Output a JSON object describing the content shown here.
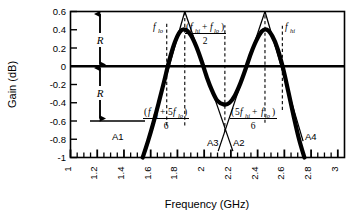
{
  "chart_data": {
    "type": "line",
    "title": "",
    "xlabel": "Frequency  (GHz)",
    "ylabel": "Gain (dB)",
    "xlim": [
      1,
      3.05
    ],
    "ylim": [
      -1,
      0.6
    ],
    "grid": false,
    "legend": "none",
    "xticks": [
      "1",
      "1.2",
      "1.4",
      "1.6",
      "1.8",
      "2",
      "2.2",
      "2.4",
      "2.6",
      "2.8",
      "3"
    ],
    "xtick_values": [
      1,
      1.2,
      1.4,
      1.6,
      1.8,
      2,
      2.2,
      2.4,
      2.6,
      2.8,
      3
    ],
    "minor_xtick_step": 0.05,
    "yticks": [
      "0.6",
      "0.4",
      "0.2",
      "0",
      "-0.2",
      "-0.4",
      "-0.6",
      "-0.8",
      "-1"
    ],
    "ytick_values": [
      0.6,
      0.4,
      0.2,
      0,
      -0.2,
      -0.4,
      -0.6,
      -0.8,
      -1
    ],
    "series": [
      {
        "name": "gain-response",
        "style": "thick-solid",
        "x": [
          1.54,
          1.58,
          1.62,
          1.66,
          1.7,
          1.74,
          1.78,
          1.82,
          1.86,
          1.9,
          1.94,
          1.98,
          2.02,
          2.06,
          2.1,
          2.15,
          2.19,
          2.23,
          2.27,
          2.31,
          2.35,
          2.39,
          2.43,
          2.47,
          2.51,
          2.55,
          2.59,
          2.63,
          2.67,
          2.71,
          2.75
        ],
        "y": [
          -1.0,
          -0.82,
          -0.62,
          -0.4,
          -0.17,
          0.07,
          0.26,
          0.38,
          0.4,
          0.34,
          0.22,
          0.06,
          -0.12,
          -0.27,
          -0.38,
          -0.42,
          -0.4,
          -0.32,
          -0.19,
          -0.03,
          0.14,
          0.28,
          0.38,
          0.4,
          0.33,
          0.19,
          -0.02,
          -0.28,
          -0.55,
          -0.8,
          -1.0
        ]
      },
      {
        "name": "asymptote-A1",
        "style": "thin-solid",
        "x": [
          1.545,
          1.855
        ],
        "y": [
          -1.0,
          0.6
        ]
      },
      {
        "name": "asymptote-A3",
        "style": "thin-solid",
        "x": [
          1.855,
          2.215
        ],
        "y": [
          0.6,
          -0.93
        ]
      },
      {
        "name": "asymptote-A2",
        "style": "thin-solid",
        "x": [
          2.105,
          2.455
        ],
        "y": [
          -0.93,
          0.6
        ]
      },
      {
        "name": "asymptote-A4",
        "style": "thin-solid",
        "x": [
          2.455,
          2.74
        ],
        "y": [
          0.6,
          -0.82
        ]
      }
    ],
    "vertical_dashed_lines": [
      {
        "name": "f-lo-line",
        "x": 1.72,
        "y0": -0.65,
        "y1": 0.47
      },
      {
        "name": "peak-lo-line",
        "x": 1.855,
        "y0": -0.65,
        "y1": 0.6
      },
      {
        "name": "mid-line",
        "x": 2.155,
        "y0": -0.72,
        "y1": 0.45
      },
      {
        "name": "peak-hi-line",
        "x": 2.455,
        "y0": -0.62,
        "y1": 0.6
      },
      {
        "name": "f-hi-line",
        "x": 2.585,
        "y0": -0.48,
        "y1": 0.47
      }
    ],
    "annotations": [
      {
        "name": "f-lo",
        "text": "f_lo",
        "base": "f",
        "sub": "lo",
        "x": 1.66,
        "y": 0.44
      },
      {
        "name": "f-hi",
        "text": "f_hi",
        "base": "f",
        "sub": "hi",
        "x": 2.63,
        "y": 0.44
      },
      {
        "name": "mid-formula",
        "text": "(f_hi + f_lo) / 2",
        "x": 2.06,
        "y": 0.45
      },
      {
        "name": "lower-sixth-formula",
        "text": "(f_hi + 5f_lo) / 6",
        "x": 1.77,
        "y": -0.51
      },
      {
        "name": "upper-sixth-formula",
        "text": "(5f_hi + f_lo) / 6",
        "x": 2.34,
        "y": -0.51
      },
      {
        "name": "label-A1",
        "text": "A1",
        "x": 1.47,
        "y": -0.78
      },
      {
        "name": "label-A2",
        "text": "A2",
        "x": 2.26,
        "y": -0.85
      },
      {
        "name": "label-A3",
        "text": "A3",
        "x": 2.06,
        "y": -0.85
      },
      {
        "name": "label-A4",
        "text": "A4",
        "x": 2.79,
        "y": -0.78
      },
      {
        "name": "ripple-upper",
        "text": "R",
        "x": 1.29,
        "y": 0.3
      },
      {
        "name": "ripple-lower",
        "text": "R",
        "x": 1.29,
        "y": -0.3
      }
    ],
    "ripple_arrows": [
      {
        "name": "ripple-arrow-upper",
        "x": 1.345,
        "y0": 0.0,
        "y1": 0.6
      },
      {
        "name": "ripple-arrow-lower",
        "x": 1.345,
        "y0": 0.0,
        "y1": -0.6
      }
    ],
    "reference_lines": [
      {
        "name": "zero-db-line",
        "y": 0
      },
      {
        "name": "minus-0p6-reference",
        "y": -0.6,
        "x0": 1.22,
        "x1": 1.63
      }
    ]
  },
  "axes": {
    "y_title": "Gain (dB)",
    "x_title": "Frequency  (GHz)"
  },
  "math": {
    "f": "f",
    "lo": "lo",
    "hi": "hi",
    "plus": "+",
    "five": "5",
    "two": "2",
    "six": "6",
    "paren_open": "(",
    "paren_close": ")"
  },
  "labels": {
    "a1": "A1",
    "a2": "A2",
    "a3": "A3",
    "a4": "A4",
    "R": "R"
  }
}
